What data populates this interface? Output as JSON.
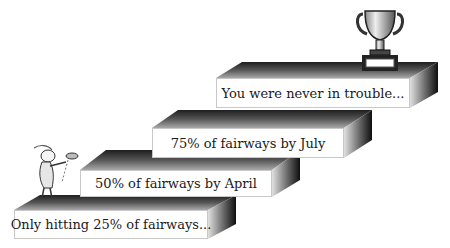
{
  "steps": [
    {
      "label": "Only hitting 25% of fairways..."
    },
    {
      "label": "50% of fairways by April"
    },
    {
      "label": "75% of fairways by July"
    },
    {
      "label": "You were never in trouble..."
    }
  ],
  "icons": {
    "golfer": "golfer-illustration",
    "trophy": "trophy-icon"
  }
}
